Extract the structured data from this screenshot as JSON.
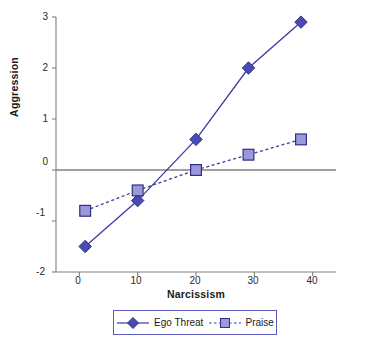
{
  "chart_data": {
    "type": "line",
    "title": "",
    "xlabel": "Narcissism",
    "ylabel": "Aggression",
    "xlim": [
      -4,
      44
    ],
    "ylim": [
      -2,
      3
    ],
    "xticks": [
      0,
      10,
      20,
      30,
      40
    ],
    "yticks": [
      3,
      2,
      1,
      0,
      -1,
      -2
    ],
    "grid": false,
    "zero_line": 0,
    "legend_position": "bottom",
    "series": [
      {
        "name": "Ego Threat",
        "marker": "diamond",
        "linestyle": "solid",
        "color": "#3b3b9e",
        "marker_fill": "#4a4ab5",
        "x": [
          1,
          10,
          20,
          29,
          38
        ],
        "y": [
          -1.5,
          -0.6,
          0.6,
          2.0,
          2.9
        ]
      },
      {
        "name": "Praise",
        "marker": "square",
        "linestyle": "dashed",
        "color": "#3b3b9e",
        "marker_fill": "#9a9ada",
        "x": [
          1,
          10,
          20,
          29,
          38
        ],
        "y": [
          -0.8,
          -0.4,
          0.0,
          0.3,
          0.6
        ]
      }
    ]
  },
  "axes": {
    "y_title": "Aggression",
    "x_title": "Narcissism",
    "y_tick_labels": [
      "3",
      "2",
      "1",
      "0",
      "-1",
      "-2"
    ],
    "x_tick_labels": [
      "0",
      "10",
      "20",
      "30",
      "40"
    ]
  },
  "legend": {
    "entries": [
      {
        "label": "Ego Threat"
      },
      {
        "label": "Praise"
      }
    ]
  },
  "colors": {
    "series_line": "#3b3b9e",
    "ego_marker": "#4a4ab5",
    "praise_marker": "#9a9ada",
    "axis": "#808080",
    "zero_line": "#808080",
    "legend_border": "#5b5bbd"
  }
}
